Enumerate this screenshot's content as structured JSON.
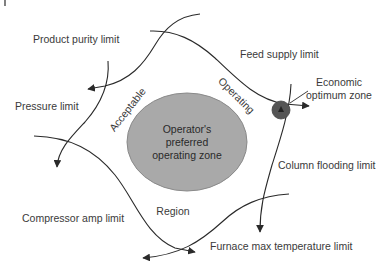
{
  "diagram": {
    "colors": {
      "line": "#2a2a2a",
      "text": "#3a3a3a",
      "preferred_zone_fill": "#a9a9a9",
      "preferred_zone_stroke": "#8a8a8a",
      "optimum_zone_fill": "#555555"
    },
    "preferred_zone": {
      "line1": "Operator's",
      "line2": "preferred",
      "line3": "operating zone"
    },
    "region_words": {
      "acceptable": "Acceptable",
      "operating": "Operating",
      "region": "Region"
    },
    "limits": {
      "product_purity": "Product purity limit",
      "feed_supply": "Feed supply limit",
      "pressure": "Pressure limit",
      "compressor_amp": "Compressor amp limit",
      "column_flooding": "Column flooding limit",
      "furnace_max_temp": "Furnace max temperature limit"
    },
    "optimum": {
      "line1": "Economic",
      "line2": "optimum zone"
    }
  }
}
